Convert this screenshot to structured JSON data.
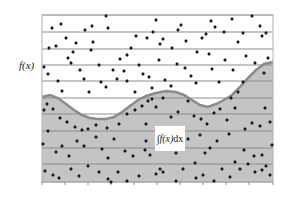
{
  "figure": {
    "y_axis_label": "f(x)",
    "integral_label": {
      "sign": "∫",
      "integrand": "f(x)",
      "differential": "dx"
    },
    "colors": {
      "background": "#ffffff",
      "area_fill": "#c4c4c4",
      "curve_stroke": "#8a8a8a",
      "gridline": "#8c8c8c",
      "frame": "#b0b0b0",
      "point": "#1a1a1a"
    },
    "frame": {
      "left": 42,
      "top": 15,
      "right": 273,
      "bottom": 182
    },
    "gridlines_y": [
      15,
      32,
      49,
      65,
      81,
      98,
      114,
      131,
      148,
      164,
      182
    ],
    "ticks_x": [
      42,
      65,
      88,
      111,
      134,
      157,
      180,
      203,
      226,
      249,
      273
    ],
    "curve": [
      [
        42,
        97
      ],
      [
        50,
        95
      ],
      [
        58,
        98
      ],
      [
        66,
        104
      ],
      [
        74,
        110
      ],
      [
        82,
        115
      ],
      [
        90,
        118
      ],
      [
        98,
        119
      ],
      [
        106,
        119
      ],
      [
        114,
        117
      ],
      [
        122,
        112
      ],
      [
        130,
        106
      ],
      [
        138,
        100
      ],
      [
        146,
        96
      ],
      [
        156,
        93
      ],
      [
        166,
        91
      ],
      [
        176,
        92
      ],
      [
        184,
        95
      ],
      [
        192,
        100
      ],
      [
        200,
        105
      ],
      [
        208,
        107
      ],
      [
        216,
        104
      ],
      [
        224,
        100
      ],
      [
        232,
        95
      ],
      [
        240,
        87
      ],
      [
        248,
        78
      ],
      [
        256,
        70
      ],
      [
        264,
        64
      ],
      [
        273,
        62
      ]
    ],
    "points": [
      [
        52,
        28
      ],
      [
        61,
        24
      ],
      [
        66,
        38
      ],
      [
        56,
        46
      ],
      [
        49,
        48
      ],
      [
        68,
        58
      ],
      [
        73,
        52
      ],
      [
        76,
        43
      ],
      [
        85,
        30
      ],
      [
        92,
        26
      ],
      [
        93,
        42
      ],
      [
        91,
        50
      ],
      [
        106,
        16
      ],
      [
        108,
        28
      ],
      [
        99,
        65
      ],
      [
        113,
        70
      ],
      [
        120,
        59
      ],
      [
        127,
        55
      ],
      [
        131,
        48
      ],
      [
        136,
        36
      ],
      [
        139,
        65
      ],
      [
        147,
        38
      ],
      [
        153,
        32
      ],
      [
        156,
        20
      ],
      [
        163,
        39
      ],
      [
        160,
        44
      ],
      [
        172,
        48
      ],
      [
        178,
        30
      ],
      [
        181,
        25
      ],
      [
        186,
        41
      ],
      [
        197,
        52
      ],
      [
        202,
        38
      ],
      [
        206,
        34
      ],
      [
        211,
        21
      ],
      [
        215,
        27
      ],
      [
        224,
        32
      ],
      [
        232,
        19
      ],
      [
        238,
        42
      ],
      [
        243,
        33
      ],
      [
        246,
        56
      ],
      [
        252,
        16
      ],
      [
        260,
        26
      ],
      [
        262,
        36
      ],
      [
        266,
        33
      ],
      [
        44,
        67
      ],
      [
        48,
        74
      ],
      [
        58,
        81
      ],
      [
        62,
        91
      ],
      [
        71,
        63
      ],
      [
        80,
        70
      ],
      [
        84,
        79
      ],
      [
        89,
        92
      ],
      [
        101,
        82
      ],
      [
        106,
        87
      ],
      [
        117,
        79
      ],
      [
        124,
        71
      ],
      [
        127,
        81
      ],
      [
        135,
        92
      ],
      [
        143,
        74
      ],
      [
        149,
        77
      ],
      [
        152,
        88
      ],
      [
        159,
        60
      ],
      [
        165,
        80
      ],
      [
        171,
        86
      ],
      [
        177,
        64
      ],
      [
        185,
        68
      ],
      [
        191,
        76
      ],
      [
        196,
        83
      ],
      [
        209,
        54
      ],
      [
        212,
        69
      ],
      [
        219,
        82
      ],
      [
        225,
        60
      ],
      [
        233,
        70
      ],
      [
        238,
        92
      ],
      [
        243,
        82
      ],
      [
        255,
        63
      ],
      [
        264,
        73
      ],
      [
        268,
        58
      ],
      [
        44,
        110
      ],
      [
        47,
        104
      ],
      [
        53,
        109
      ],
      [
        60,
        118
      ],
      [
        67,
        122
      ],
      [
        75,
        127
      ],
      [
        82,
        130
      ],
      [
        88,
        129
      ],
      [
        96,
        125
      ],
      [
        107,
        128
      ],
      [
        114,
        139
      ],
      [
        119,
        124
      ],
      [
        127,
        114
      ],
      [
        135,
        110
      ],
      [
        142,
        106
      ],
      [
        148,
        101
      ],
      [
        152,
        99
      ],
      [
        156,
        107
      ],
      [
        163,
        98
      ],
      [
        171,
        117
      ],
      [
        178,
        112
      ],
      [
        188,
        101
      ],
      [
        194,
        116
      ],
      [
        201,
        119
      ],
      [
        207,
        124
      ],
      [
        214,
        113
      ],
      [
        220,
        109
      ],
      [
        227,
        120
      ],
      [
        231,
        98
      ],
      [
        235,
        108
      ],
      [
        245,
        129
      ],
      [
        252,
        123
      ],
      [
        260,
        126
      ],
      [
        265,
        108
      ],
      [
        270,
        122
      ],
      [
        43,
        144
      ],
      [
        48,
        131
      ],
      [
        56,
        152
      ],
      [
        62,
        146
      ],
      [
        69,
        156
      ],
      [
        77,
        141
      ],
      [
        84,
        146
      ],
      [
        88,
        166
      ],
      [
        96,
        137
      ],
      [
        102,
        149
      ],
      [
        108,
        158
      ],
      [
        118,
        172
      ],
      [
        125,
        151
      ],
      [
        133,
        156
      ],
      [
        139,
        176
      ],
      [
        145,
        150
      ],
      [
        146,
        124
      ],
      [
        146,
        141
      ],
      [
        150,
        155
      ],
      [
        160,
        169
      ],
      [
        176,
        153
      ],
      [
        183,
        169
      ],
      [
        188,
        139
      ],
      [
        195,
        163
      ],
      [
        200,
        135
      ],
      [
        205,
        153
      ],
      [
        210,
        148
      ],
      [
        217,
        141
      ],
      [
        222,
        169
      ],
      [
        229,
        134
      ],
      [
        235,
        162
      ],
      [
        244,
        150
      ],
      [
        248,
        164
      ],
      [
        254,
        156
      ],
      [
        262,
        155
      ],
      [
        266,
        166
      ],
      [
        272,
        145
      ],
      [
        45,
        171
      ],
      [
        53,
        175
      ],
      [
        59,
        178
      ],
      [
        71,
        169
      ],
      [
        79,
        176
      ],
      [
        99,
        172
      ],
      [
        108,
        179
      ],
      [
        111,
        182
      ],
      [
        127,
        181
      ],
      [
        156,
        174
      ],
      [
        163,
        172
      ],
      [
        176,
        181
      ],
      [
        196,
        178
      ],
      [
        203,
        175
      ],
      [
        214,
        181
      ],
      [
        230,
        177
      ],
      [
        240,
        169
      ],
      [
        255,
        172
      ],
      [
        262,
        170
      ],
      [
        270,
        175
      ]
    ]
  }
}
